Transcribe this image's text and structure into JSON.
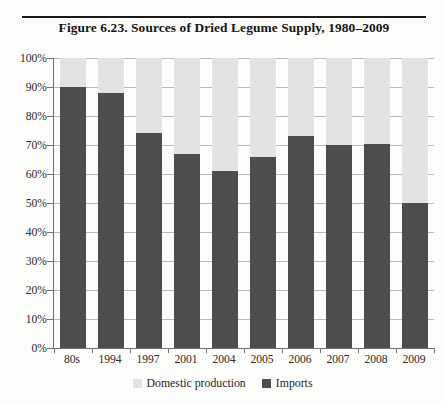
{
  "figure": {
    "title": "Figure 6.23. Sources of Dried Legume Supply, 1980–2009"
  },
  "legend": {
    "position": "bottom-center",
    "entries": [
      {
        "label": "Domestic production",
        "color": "#e3e3e3"
      },
      {
        "label": "Imports",
        "color": "#4d4d4d"
      }
    ]
  },
  "chart_data": {
    "type": "bar",
    "subtype": "stacked-column",
    "title": "Figure 6.23. Sources of Dried Legume Supply, 1980–2009",
    "xlabel": "",
    "ylabel": "",
    "ylim": [
      0,
      100
    ],
    "yunit": "%",
    "grid": true,
    "categories": [
      "80s",
      "1994",
      "1997",
      "2001",
      "2004",
      "2005",
      "2006",
      "2007",
      "2008",
      "2009"
    ],
    "ytick_labels": [
      "0%",
      "10%",
      "20%",
      "30%",
      "40%",
      "50%",
      "60%",
      "70%",
      "80%",
      "90%",
      "100%"
    ],
    "ytick_values": [
      0,
      10,
      20,
      30,
      40,
      50,
      60,
      70,
      80,
      90,
      100
    ],
    "series": [
      {
        "name": "Imports",
        "color": "#4d4d4d",
        "values": [
          90,
          88,
          74,
          67,
          61,
          66,
          73,
          70,
          70.5,
          50
        ]
      },
      {
        "name": "Domestic production",
        "color": "#e3e3e3",
        "values": [
          10,
          12,
          26,
          33,
          39,
          34,
          27,
          30,
          29.5,
          50
        ]
      }
    ]
  }
}
